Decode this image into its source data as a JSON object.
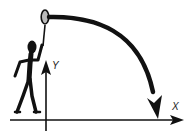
{
  "diagram": {
    "type": "projectile-motion",
    "axes": {
      "x_label": "X",
      "y_label": "Y"
    },
    "colors": {
      "ink": "#111111",
      "background": "#ffffff"
    },
    "elements": [
      "stick-figure",
      "racket",
      "trajectory-arrow",
      "x-axis",
      "y-axis"
    ]
  }
}
